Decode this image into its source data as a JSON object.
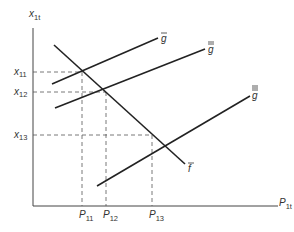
{
  "diagram": {
    "axes": {
      "y_label": {
        "main": "x",
        "sub": "1t"
      },
      "x_label": {
        "main": "P",
        "sub": "1t"
      }
    },
    "curves": [
      {
        "name": "f",
        "label": "f",
        "bars": 1
      },
      {
        "name": "g1",
        "label": "g",
        "bars": 1
      },
      {
        "name": "g2",
        "label": "g",
        "bars": 2
      },
      {
        "name": "g3",
        "label": "g",
        "bars": 3
      }
    ],
    "y_ticks": [
      {
        "main": "x",
        "sub": "11"
      },
      {
        "main": "x",
        "sub": "12"
      },
      {
        "main": "x",
        "sub": "13"
      }
    ],
    "x_ticks": [
      {
        "main": "P",
        "sub": "11"
      },
      {
        "main": "P",
        "sub": "12"
      },
      {
        "main": "P",
        "sub": "13"
      }
    ]
  }
}
